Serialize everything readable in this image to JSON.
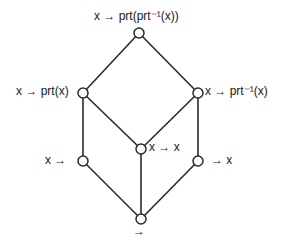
{
  "diagram": {
    "type": "lattice",
    "nodes": [
      {
        "id": "top",
        "x": 139,
        "y": 33,
        "label": "x → prt(prt⁻¹(x))"
      },
      {
        "id": "left_upper",
        "x": 83,
        "y": 93,
        "label": "x → prt(x)"
      },
      {
        "id": "right_upper",
        "x": 198,
        "y": 93,
        "label": "x → prt⁻¹(x)"
      },
      {
        "id": "center",
        "x": 141,
        "y": 149,
        "label": "x → x"
      },
      {
        "id": "left_lower",
        "x": 83,
        "y": 161,
        "label": "x →"
      },
      {
        "id": "right_lower",
        "x": 198,
        "y": 161,
        "label": "→ x"
      },
      {
        "id": "bottom",
        "x": 141,
        "y": 219,
        "label": "→"
      }
    ],
    "edges": [
      [
        "top",
        "left_upper"
      ],
      [
        "top",
        "right_upper"
      ],
      [
        "left_upper",
        "left_lower"
      ],
      [
        "left_upper",
        "center"
      ],
      [
        "right_upper",
        "center"
      ],
      [
        "right_upper",
        "right_lower"
      ],
      [
        "center",
        "bottom"
      ],
      [
        "left_lower",
        "bottom"
      ],
      [
        "right_lower",
        "bottom"
      ]
    ]
  },
  "labels": {
    "top": "x → prt(prt⁻¹(x))",
    "left_upper": "x → prt(x)",
    "right_upper": "x → prt⁻¹(x)",
    "center": "x → x",
    "left_lower": "x →",
    "right_lower": "→ x",
    "bottom": "→"
  }
}
